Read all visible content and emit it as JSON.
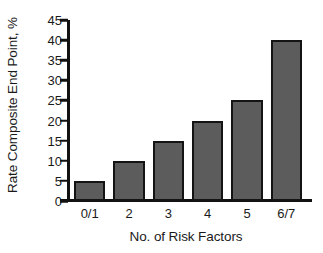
{
  "chart_data": {
    "type": "bar",
    "title": "",
    "subtitle": "",
    "xlabel": "No. of Risk Factors",
    "ylabel": "Rate Composite End Point, %",
    "categories": [
      "0/1",
      "2",
      "3",
      "4",
      "5",
      "6/7"
    ],
    "values": [
      5,
      10,
      15,
      20,
      25,
      40
    ],
    "series": [
      {
        "name": "Rate Composite End Point, %",
        "values": [
          5,
          10,
          15,
          20,
          25,
          40
        ]
      }
    ],
    "ylim": [
      0,
      45
    ],
    "yticks": [
      0,
      5,
      10,
      15,
      20,
      25,
      30,
      35,
      40,
      45
    ],
    "ytick_labels": [
      "0",
      "5",
      "10",
      "15",
      "20",
      "25",
      "30",
      "35",
      "40",
      "45"
    ],
    "grid": false,
    "legend": false,
    "legend_position": "none",
    "annotations": [],
    "colors": {
      "bar_fill": "#5c5c5c",
      "bar_edge": "#141414",
      "axis": "#111111",
      "text": "#1a1a1a",
      "background": "#ffffff"
    }
  }
}
